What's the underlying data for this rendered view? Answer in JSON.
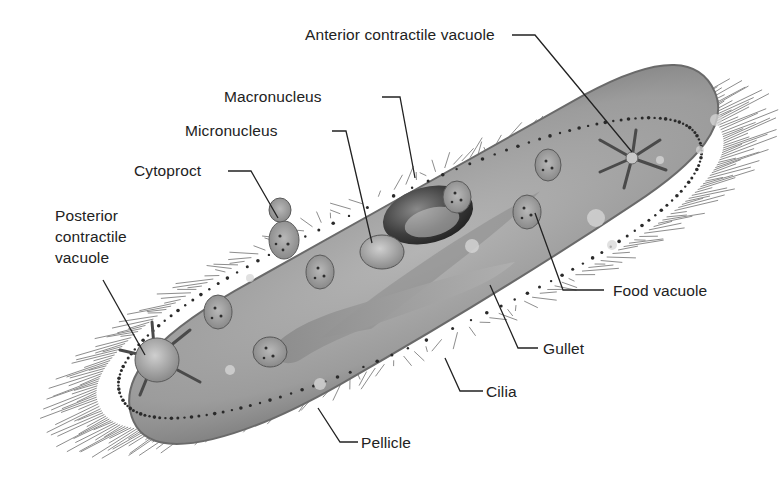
{
  "diagram": {
    "colors": {
      "background": "#ffffff",
      "body_fill": "#9a9a9a",
      "body_dark": "#6e6e6e",
      "pellicle_dots": "#2a2a2a",
      "cilia": "#7a7a7a",
      "leader_line": "#222222",
      "label_text": "#222222"
    },
    "labels": [
      {
        "id": "anterior-contractile-vacuole",
        "text": "Anterior contractile vacuole",
        "x": 305,
        "y": 26,
        "line": [
          [
            512,
            35
          ],
          [
            535,
            35
          ],
          [
            632,
            152
          ]
        ]
      },
      {
        "id": "macronucleus",
        "text": "Macronucleus",
        "x": 224,
        "y": 88,
        "line": [
          [
            382,
            97
          ],
          [
            400,
            97
          ],
          [
            415,
            178
          ]
        ]
      },
      {
        "id": "micronucleus",
        "text": "Micronucleus",
        "x": 185,
        "y": 122,
        "line": [
          [
            332,
            131
          ],
          [
            346,
            131
          ],
          [
            372,
            243
          ]
        ]
      },
      {
        "id": "cytoproct",
        "text": "Cytoproct",
        "x": 134,
        "y": 162,
        "line": [
          [
            228,
            171
          ],
          [
            251,
            171
          ],
          [
            278,
            218
          ]
        ]
      },
      {
        "id": "posterior-contractile-vacuole",
        "text": "Posterior\ncontractile\nvacuole",
        "x": 55,
        "y": 205,
        "line": [
          [
            103,
            280
          ],
          [
            145,
            355
          ]
        ]
      },
      {
        "id": "food-vacuole",
        "text": "Food vacuole",
        "x": 613,
        "y": 282,
        "line": [
          [
            604,
            290
          ],
          [
            563,
            290
          ],
          [
            535,
            213
          ]
        ]
      },
      {
        "id": "gullet",
        "text": "Gullet",
        "x": 543,
        "y": 340,
        "line": [
          [
            538,
            348
          ],
          [
            518,
            348
          ],
          [
            490,
            285
          ]
        ]
      },
      {
        "id": "cilia",
        "text": "Cilia",
        "x": 486,
        "y": 383,
        "line": [
          [
            483,
            391
          ],
          [
            460,
            391
          ],
          [
            445,
            358
          ]
        ]
      },
      {
        "id": "pellicle",
        "text": "Pellicle",
        "x": 361,
        "y": 434,
        "line": [
          [
            358,
            442
          ],
          [
            340,
            442
          ],
          [
            318,
            408
          ]
        ]
      }
    ]
  }
}
